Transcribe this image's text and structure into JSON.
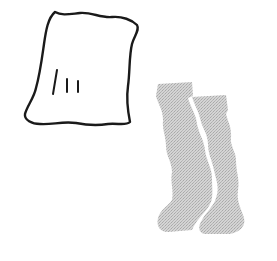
{
  "scene": {
    "description": "Line-art illustration of a towel and a pair of socks",
    "objects": [
      {
        "name": "towel",
        "style": "black hand-drawn outline",
        "color": "#1a1a1a"
      },
      {
        "name": "socks",
        "style": "gray stippled fill, pair",
        "color": "#c8c8c8"
      }
    ],
    "background": "#ffffff"
  }
}
